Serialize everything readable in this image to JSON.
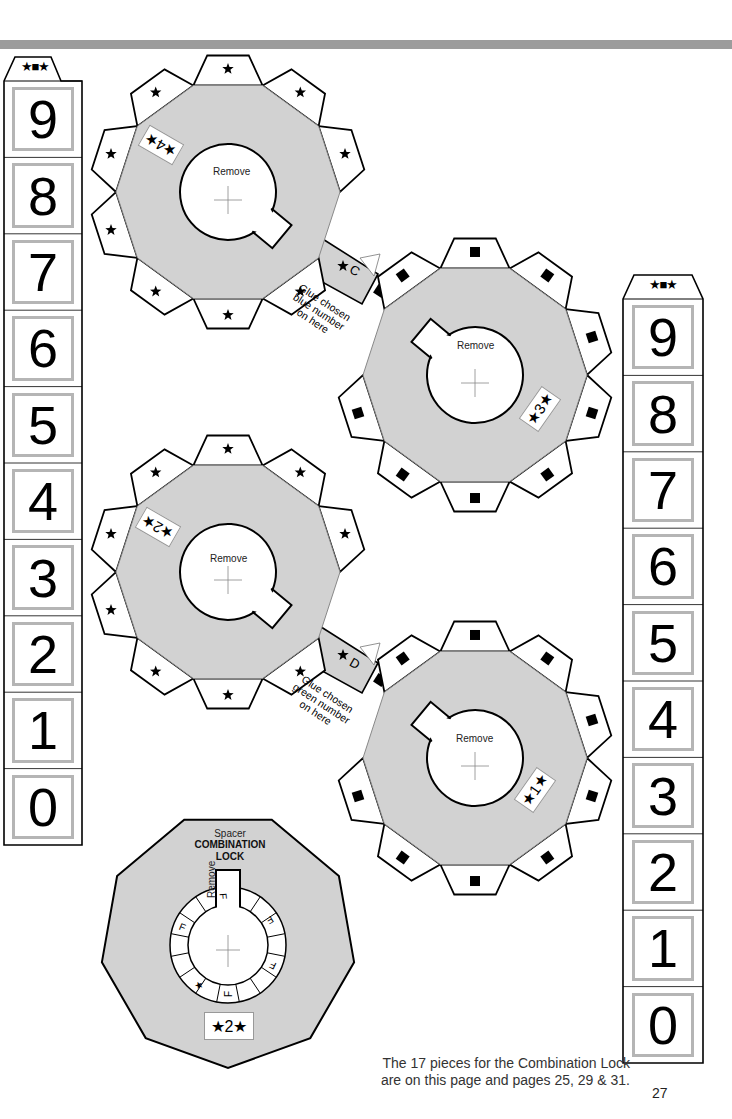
{
  "page": {
    "number": "27",
    "caption_line1": "The 17 pieces for the Combination Lock",
    "caption_line2": "are on this page and pages 25, 29 & 31.",
    "colors": {
      "piece_fill": "#d2d2d2",
      "outline": "#000000",
      "digit_frame": "#b5b5b5",
      "top_bar": "#9c9c9c"
    }
  },
  "left_strip": {
    "cap_symbols": "★■★",
    "digits": [
      "9",
      "8",
      "7",
      "6",
      "5",
      "4",
      "3",
      "2",
      "1",
      "0"
    ]
  },
  "right_strip": {
    "cap_symbols": "★■★",
    "digits": [
      "9",
      "8",
      "7",
      "6",
      "5",
      "4",
      "3",
      "2",
      "1",
      "0"
    ]
  },
  "gears": [
    {
      "id": "wheel-4",
      "center_label": "Remove",
      "tab_icon": "star",
      "number_label": "★4★"
    },
    {
      "id": "wheel-3",
      "center_label": "Remove",
      "tab_icon": "square",
      "number_label": "★3★"
    },
    {
      "id": "wheel-2",
      "center_label": "Remove",
      "tab_icon": "star",
      "number_label": "★2★"
    },
    {
      "id": "wheel-1",
      "center_label": "Remove",
      "tab_icon": "square",
      "number_label": "★1★"
    }
  ],
  "connectors": [
    {
      "letter": "C",
      "text_lines": [
        "Glue chosen",
        "blue number",
        "on here"
      ]
    },
    {
      "letter": "D",
      "text_lines": [
        "Glue chosen",
        "green number",
        "on here"
      ]
    }
  ],
  "spacer": {
    "title": "Spacer",
    "name_line1": "COMBINATION",
    "name_line2": "LOCK",
    "remove_label": "Remove",
    "ring_marks": [
      "★",
      "F",
      "F",
      "F",
      "F",
      "F"
    ],
    "number_label": "★2★"
  }
}
